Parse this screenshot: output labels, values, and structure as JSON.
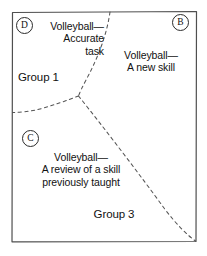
{
  "diagram": {
    "frame": {
      "stroke": "#4a4a4a",
      "fill": "#ffffff"
    },
    "divider_stroke": "#555555",
    "zones": [
      {
        "id": "D",
        "marker": "D",
        "text_lines": "Volleyball—\nAccurate\ntask",
        "group_label": "Group 1"
      },
      {
        "id": "B",
        "marker": "B",
        "text_lines": "Volleyball—\nA new skill",
        "group_label": ""
      },
      {
        "id": "C",
        "marker": "C",
        "text_lines": "Volleyball—\nA review of a skill\npreviously taught",
        "group_label": "Group 3"
      }
    ]
  }
}
